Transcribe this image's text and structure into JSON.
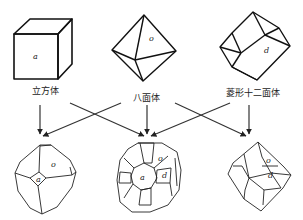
{
  "top_row": [
    {
      "name": "立方体",
      "face_label": "a"
    },
    {
      "name": "八面体",
      "face_label": "o"
    },
    {
      "name": "菱形十二面体",
      "face_label": "d"
    }
  ],
  "bottom_row": [
    {
      "face_labels": [
        "o",
        "a"
      ]
    },
    {
      "face_labels": [
        "o",
        "a",
        "d"
      ]
    },
    {
      "face_labels": [
        "o",
        "d"
      ]
    }
  ],
  "colors": {
    "line": "#1a1a1a",
    "arrow": "#333333",
    "background": "#ffffff"
  }
}
